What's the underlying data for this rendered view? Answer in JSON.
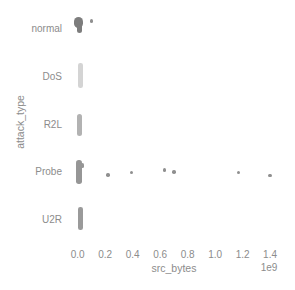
{
  "figure": {
    "background": "#ffffff",
    "text_color": "#8c8c8c"
  },
  "chart_data": {
    "type": "scatter",
    "variant": "strip-plot",
    "orientation": "horizontal",
    "title": "",
    "xlabel": "src_bytes",
    "ylabel": "attack_type",
    "x_scale_offset_label": "1e9",
    "x_unit_multiplier": 1000000000,
    "xlim": [
      -0.05,
      1.45
    ],
    "x_ticks": [
      {
        "label": "0.0",
        "value": 0.0
      },
      {
        "label": "0.2",
        "value": 0.2
      },
      {
        "label": "0.4",
        "value": 0.4
      },
      {
        "label": "0.6",
        "value": 0.6
      },
      {
        "label": "0.8",
        "value": 0.8
      },
      {
        "label": "1.0",
        "value": 1.0
      },
      {
        "label": "1.2",
        "value": 1.2
      },
      {
        "label": "1.4",
        "value": 1.4
      }
    ],
    "grid": false,
    "legend": false,
    "point_color": "#8f8f8f",
    "rows": [
      {
        "label": "normal",
        "zero_cluster": true,
        "cluster": {
          "color": "#7d7d7d",
          "blobs": [
            {
              "dx": -3.5,
              "dy": -12,
              "w": 9,
              "h": 11
            },
            {
              "dx": -1,
              "dy": -5,
              "w": 5,
              "h": 9
            }
          ]
        },
        "outliers": [
          {
            "value": 0.1,
            "dy": -8
          }
        ]
      },
      {
        "label": "DoS",
        "zero_cluster": true,
        "cluster": {
          "color": "#d4d4d4",
          "blobs": [
            {
              "dx": 0.3,
              "dy": -13.5,
              "w": 4.5,
              "h": 25
            }
          ]
        },
        "outliers": []
      },
      {
        "label": "R2L",
        "zero_cluster": true,
        "cluster": {
          "color": "#b2b2b2",
          "blobs": [
            {
              "dx": -0.7,
              "dy": -10.5,
              "w": 5,
              "h": 22
            }
          ]
        },
        "outliers": []
      },
      {
        "label": "Probe",
        "zero_cluster": true,
        "cluster": {
          "color": "#969696",
          "blobs": [
            {
              "dx": -1.7,
              "dy": -12,
              "w": 5.5,
              "h": 24
            },
            {
              "dx": 3.3,
              "dy": -9,
              "w": 3,
              "h": 5
            }
          ]
        },
        "outliers": [
          {
            "value": 0.22,
            "dy": 2.5
          },
          {
            "value": 0.39,
            "dy": 0
          },
          {
            "value": 0.63,
            "dy": -2.5
          },
          {
            "value": 0.7,
            "dy": -0.5
          },
          {
            "value": 1.17,
            "dy": 0
          },
          {
            "value": 1.4,
            "dy": 3
          }
        ]
      },
      {
        "label": "U2R",
        "zero_cluster": true,
        "cluster": {
          "color": "#9a9a9a",
          "blobs": [
            {
              "dx": 0.3,
              "dy": -13,
              "w": 4.5,
              "h": 23
            }
          ]
        },
        "outliers": []
      }
    ]
  }
}
